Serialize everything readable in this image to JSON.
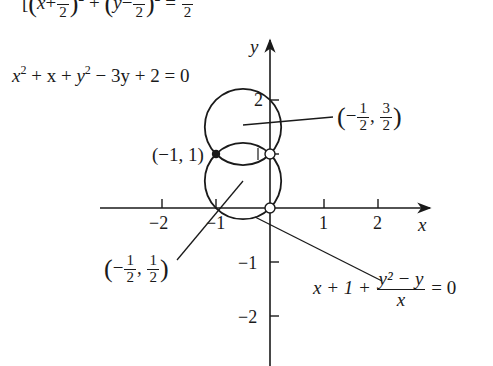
{
  "figure": {
    "top_equation": {
      "prefix": "[",
      "term1_open": "(",
      "term1_var": "x",
      "term1_op": "+",
      "term1_num": "1",
      "term1_den": "2",
      "term1_close": ")",
      "term1_exp": "2",
      "plus": "+",
      "term2_open": "(",
      "term2_var": "y",
      "term2_op": "−",
      "term2_num": "1",
      "term2_den": "2",
      "term2_close": ")",
      "term2_exp": "2",
      "equals": "=",
      "rhs_num": "1",
      "rhs_den": "2"
    },
    "circle_equation": {
      "text_a": "x",
      "exp_a": "2",
      "text_b": " + x + ",
      "text_c": "y",
      "exp_c": "2",
      "text_d": " − 3y + 2 = 0"
    },
    "curve_equation": {
      "lhs": "x + 1 + ",
      "num": "y² − y",
      "den": "x",
      "rhs": " = 0"
    },
    "axes": {
      "x_label": "x",
      "y_label": "y",
      "x_ticks": [
        {
          "value": -2,
          "label": "−2"
        },
        {
          "value": -1,
          "label": "−1"
        },
        {
          "value": 1,
          "label": "1"
        },
        {
          "value": 2,
          "label": "2"
        }
      ],
      "y_ticks": [
        {
          "value": 2,
          "label": "2"
        },
        {
          "value": 1,
          "label": "1"
        },
        {
          "value": -1,
          "label": "−1"
        },
        {
          "value": -2,
          "label": "−2"
        }
      ],
      "origin_px": [
        270,
        208
      ],
      "unit_px": 54
    },
    "annotations": {
      "point_neg1_1": "(−1, 1)",
      "center_upper": {
        "open": "(",
        "sign": "−",
        "n1": "1",
        "d1": "2",
        "comma": ",",
        "n2": "3",
        "d2": "2",
        "close": ")"
      },
      "center_lower": {
        "open": "(",
        "sign": "−",
        "n1": "1",
        "d1": "2",
        "comma": ",",
        "n2": "1",
        "d2": "2",
        "close": ")"
      }
    },
    "circles": [
      {
        "name": "upper",
        "cx": -0.5,
        "cy": 1.5,
        "r": 0.7071
      },
      {
        "name": "lower",
        "cx": -0.5,
        "cy": 0.5,
        "r": 0.7071
      }
    ],
    "points": {
      "filled": [
        [
          -1,
          1
        ]
      ],
      "open": [
        [
          0,
          1
        ],
        [
          0,
          0
        ]
      ]
    },
    "colors": {
      "ink": "#1a1a1a",
      "background": "#ffffff"
    }
  }
}
